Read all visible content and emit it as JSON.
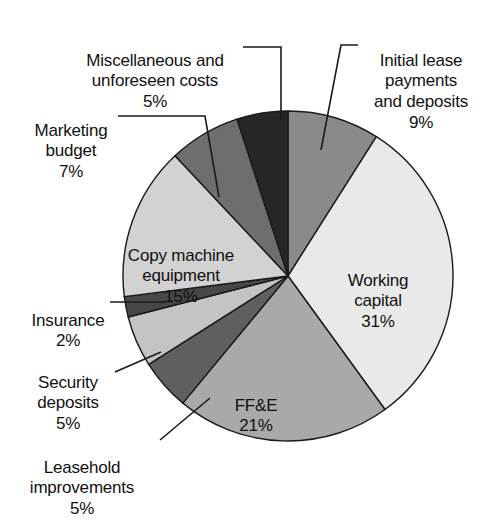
{
  "chart_data": {
    "type": "pie",
    "title": "",
    "subtitle": "",
    "xlabel": "",
    "ylabel": "",
    "legend_position": "none",
    "grid": false,
    "units": "percent",
    "total": 100,
    "start_angle_deg": 0,
    "direction": "clockwise",
    "categories": [
      "Initial lease payments and deposits",
      "Working capital",
      "FF&E",
      "Leasehold improvements",
      "Security deposits",
      "Insurance",
      "Copy machine equipment",
      "Marketing budget",
      "Miscellaneous and unforeseen costs"
    ],
    "values": [
      9,
      31,
      21,
      5,
      5,
      2,
      15,
      7,
      5
    ],
    "colors": [
      "#8a8a8a",
      "#e9e9e9",
      "#a9a9a9",
      "#5f5f5f",
      "#c4c4c4",
      "#474747",
      "#d2d2d2",
      "#6e6e6e",
      "#262626"
    ],
    "slices": [
      {
        "label": "Initial lease payments and deposits",
        "value": 9,
        "value_text": "9%",
        "color": "#8a8a8a"
      },
      {
        "label": "Working capital",
        "value": 31,
        "value_text": "31%",
        "color": "#e9e9e9"
      },
      {
        "label": "FF&E",
        "value": 21,
        "value_text": "21%",
        "color": "#a9a9a9"
      },
      {
        "label": "Leasehold improvements",
        "value": 5,
        "value_text": "5%",
        "color": "#5f5f5f"
      },
      {
        "label": "Security deposits",
        "value": 5,
        "value_text": "5%",
        "color": "#c4c4c4"
      },
      {
        "label": "Insurance",
        "value": 2,
        "value_text": "2%",
        "color": "#474747"
      },
      {
        "label": "Copy machine equipment",
        "value": 15,
        "value_text": "15%",
        "color": "#d2d2d2"
      },
      {
        "label": "Marketing budget",
        "value": 7,
        "value_text": "7%",
        "color": "#6e6e6e"
      },
      {
        "label": "Miscellaneous and unforeseen costs",
        "value": 5,
        "value_text": "5%",
        "color": "#262626"
      }
    ]
  },
  "labels": {
    "misc": {
      "name": "Miscellaneous and\nunforeseen costs",
      "pct": "5%"
    },
    "initial": {
      "name": "Initial lease\npayments\nand deposits",
      "pct": "9%"
    },
    "marketing": {
      "name": "Marketing\nbudget",
      "pct": "7%"
    },
    "copy": {
      "name": "Copy machine\nequipment",
      "pct": "15%"
    },
    "insurance": {
      "name": "Insurance",
      "pct": "2%"
    },
    "security": {
      "name": "Security\ndeposits",
      "pct": "5%"
    },
    "leasehold": {
      "name": "Leasehold\nimprovements",
      "pct": "5%"
    },
    "working": {
      "name": "Working\ncapital",
      "pct": "31%"
    },
    "ffe": {
      "name": "FF&E",
      "pct": "21%"
    }
  },
  "style": {
    "background": "#ffffff",
    "outline": "#1a1a1a",
    "text": "#111111"
  }
}
